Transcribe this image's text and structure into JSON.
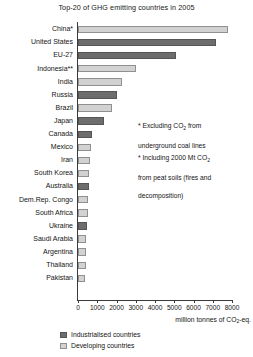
{
  "chart_data": {
    "type": "bar",
    "orientation": "horizontal",
    "title": "Top-20 of GHG emitting countries in 2005",
    "xlabel": "million tonnes of CO2-eq.",
    "xlabel_parts": {
      "pre": "million tonnes of CO",
      "sub": "2",
      "post": "-eq."
    },
    "ylabel": "",
    "xlim": [
      0,
      8000
    ],
    "xticks": [
      0,
      1000,
      2000,
      3000,
      4000,
      5000,
      6000,
      7000,
      8000
    ],
    "xtick_labels": [
      "0",
      "1000",
      "2000",
      "3000",
      "4000",
      "5000",
      "6000",
      "7000",
      "8000"
    ],
    "grid": false,
    "legend_position": "bottom-left",
    "categories": [
      "China*",
      "United States",
      "EU-27",
      "Indonesia**",
      "India",
      "Russia",
      "Brazil",
      "Japan",
      "Canada",
      "Mexico",
      "Iran",
      "South Korea",
      "Australia",
      "Dem.Rep. Congo",
      "South Africa",
      "Ukraine",
      "Saudi Arabia",
      "Argentina",
      "Thailand",
      "Pakistan"
    ],
    "values": [
      7800,
      7150,
      5100,
      3000,
      2300,
      2050,
      1750,
      1350,
      750,
      680,
      600,
      590,
      560,
      540,
      500,
      470,
      440,
      420,
      400,
      380
    ],
    "groups": [
      "developing",
      "industrialised",
      "industrialised",
      "developing",
      "developing",
      "industrialised",
      "developing",
      "industrialised",
      "industrialised",
      "developing",
      "developing",
      "developing",
      "industrialised",
      "developing",
      "developing",
      "industrialised",
      "developing",
      "developing",
      "developing",
      "developing"
    ],
    "series": [
      {
        "name": "Industrialised countries",
        "color": "#6d6d6d"
      },
      {
        "name": "Developing countries",
        "color": "#d2d2d2"
      }
    ],
    "annotations": [
      "* Excluding CO2 from\nunderground coal lines",
      "* Including 2000 Mt CO2\nfrom peat soils (fires and\ndecomposition)"
    ],
    "annotation_parts": [
      {
        "line1_pre": "* Excluding CO",
        "line1_sub": "2",
        "line1_post": " from",
        "line2": "underground coal lines"
      },
      {
        "line1_pre": "* Including 2000 Mt CO",
        "line1_sub": "2",
        "line1_post": "",
        "line2": "from peat soils (fires and",
        "line3": "decomposition)"
      }
    ]
  },
  "legend": {
    "items": [
      {
        "label": "Industrialised countries",
        "group": "industrialised"
      },
      {
        "label": "Developing countries",
        "group": "developing"
      }
    ]
  }
}
